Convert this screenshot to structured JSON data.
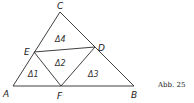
{
  "figure": {
    "caption": "Abb. 25",
    "points": {
      "A": {
        "label": "A",
        "x": 13,
        "y": 86
      },
      "B": {
        "label": "B",
        "x": 134,
        "y": 86
      },
      "C": {
        "label": "C",
        "x": 60,
        "y": 12
      },
      "D": {
        "label": "D",
        "x": 95,
        "y": 47
      },
      "E": {
        "label": "E",
        "x": 34,
        "y": 52
      },
      "F": {
        "label": "F",
        "x": 61,
        "y": 86
      }
    },
    "segments": [
      [
        "A",
        "B"
      ],
      [
        "B",
        "C"
      ],
      [
        "C",
        "A"
      ],
      [
        "E",
        "D"
      ],
      [
        "E",
        "F"
      ],
      [
        "F",
        "D"
      ]
    ],
    "regions": [
      {
        "label": "Δ1",
        "x": 30,
        "y": 77
      },
      {
        "label": "Δ2",
        "x": 57,
        "y": 65
      },
      {
        "label": "Δ3",
        "x": 89,
        "y": 77
      },
      {
        "label": "Δ4",
        "x": 57,
        "y": 41
      }
    ]
  }
}
